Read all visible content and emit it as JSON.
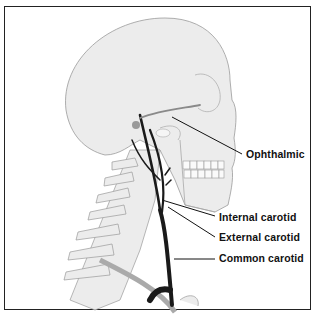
{
  "figure": {
    "colors": {
      "border": "#222222",
      "bone_fill": "#ececec",
      "bone_outline": "#9a9a9a",
      "artery": "#1a1a1a",
      "label_text": "#111111"
    }
  },
  "labels": [
    {
      "id": "ophthalmic",
      "text": "Ophthalmic"
    },
    {
      "id": "internal-carotid",
      "text": "Internal carotid"
    },
    {
      "id": "external-carotid",
      "text": "External carotid"
    },
    {
      "id": "common-carotid",
      "text": "Common carotid"
    }
  ]
}
